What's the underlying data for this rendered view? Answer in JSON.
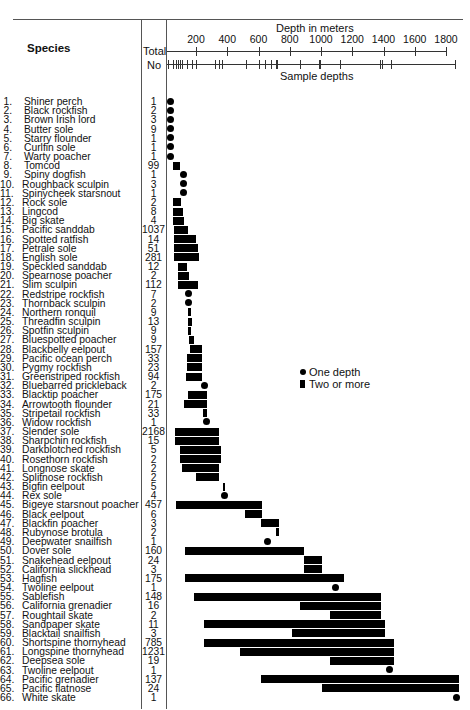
{
  "chart_data": {
    "type": "range",
    "title": "",
    "xlabel": "Depth in meters",
    "x_ticks": [
      200,
      400,
      600,
      800,
      1000,
      1200,
      1400,
      1600,
      1800
    ],
    "xlim": [
      0,
      1850
    ],
    "column_headers": {
      "species": "Species",
      "total": "Total",
      "no": "No"
    },
    "sample_depths_label": "Sample depths",
    "sample_depths": [
      20,
      55,
      75,
      85,
      95,
      110,
      145,
      175,
      200,
      320,
      345,
      365,
      520,
      600,
      640,
      680,
      710,
      720,
      865,
      985,
      995,
      1120,
      1380,
      1390,
      1450,
      1880
    ],
    "legend": [
      {
        "symbol": "dot",
        "label": "One depth"
      },
      {
        "symbol": "bar",
        "label": "Two or more"
      }
    ],
    "species": [
      {
        "n": 1,
        "name": "Shiner perch",
        "total": "1",
        "type": "dot",
        "depth": 35
      },
      {
        "n": 2,
        "name": "Black rockfish",
        "total": "2",
        "type": "dot",
        "depth": 35
      },
      {
        "n": 3,
        "name": "Brown Irish lord",
        "total": "3",
        "type": "dot",
        "depth": 35
      },
      {
        "n": 4,
        "name": "Butter sole",
        "total": "9",
        "type": "dot",
        "depth": 35
      },
      {
        "n": 5,
        "name": "Starry flounder",
        "total": "1",
        "type": "dot",
        "depth": 35
      },
      {
        "n": 6,
        "name": "Curlfin sole",
        "total": "1",
        "type": "dot",
        "depth": 35
      },
      {
        "n": 7,
        "name": "Warty poacher",
        "total": "1",
        "type": "dot",
        "depth": 35
      },
      {
        "n": 8,
        "name": "Tomcod",
        "total": "99",
        "type": "bar",
        "min": 55,
        "max": 100
      },
      {
        "n": 9,
        "name": "Spiny dogfish",
        "total": "1",
        "type": "dot",
        "depth": 120
      },
      {
        "n": 10,
        "name": "Roughback sculpin",
        "total": "3",
        "type": "dot",
        "depth": 120
      },
      {
        "n": 11,
        "name": "Spinycheek starsnout",
        "total": "1",
        "type": "dot",
        "depth": 120
      },
      {
        "n": 12,
        "name": "Rock sole",
        "total": "2",
        "type": "bar",
        "min": 55,
        "max": 105
      },
      {
        "n": 13,
        "name": "Lingcod",
        "total": "8",
        "type": "bar",
        "min": 55,
        "max": 115
      },
      {
        "n": 14,
        "name": "Big skate",
        "total": "4",
        "type": "bar",
        "min": 55,
        "max": 120
      },
      {
        "n": 15,
        "name": "Pacific sanddab",
        "total": "1037",
        "type": "bar",
        "min": 60,
        "max": 150
      },
      {
        "n": 16,
        "name": "Spotted ratfish",
        "total": "14",
        "type": "bar",
        "min": 60,
        "max": 200
      },
      {
        "n": 17,
        "name": "Petrale sole",
        "total": "51",
        "type": "bar",
        "min": 60,
        "max": 215
      },
      {
        "n": 18,
        "name": "English sole",
        "total": "281",
        "type": "bar",
        "min": 60,
        "max": 220
      },
      {
        "n": 19,
        "name": "Speckled sanddab",
        "total": "12",
        "type": "bar",
        "min": 85,
        "max": 140
      },
      {
        "n": 20,
        "name": "Spearnose poacher",
        "total": "2",
        "type": "bar",
        "min": 85,
        "max": 155
      },
      {
        "n": 21,
        "name": "Slim sculpin",
        "total": "112",
        "type": "bar",
        "min": 85,
        "max": 215
      },
      {
        "n": 22,
        "name": "Redstripe rockfish",
        "total": "7",
        "type": "dot",
        "depth": 150
      },
      {
        "n": 23,
        "name": "Thornback sculpin",
        "total": "2",
        "type": "dot",
        "depth": 150
      },
      {
        "n": 24,
        "name": "Northern ronquil",
        "total": "9",
        "type": "bar",
        "min": 150,
        "max": 170
      },
      {
        "n": 25,
        "name": "Threadfin sculpin",
        "total": "13",
        "type": "bar",
        "min": 150,
        "max": 175
      },
      {
        "n": 26,
        "name": "Spotfin sculpin",
        "total": "9",
        "type": "bar",
        "min": 150,
        "max": 170
      },
      {
        "n": 27,
        "name": "Bluespotted poacher",
        "total": "9",
        "type": "bar",
        "min": 155,
        "max": 190
      },
      {
        "n": 28,
        "name": "Blackbelly eelpout",
        "total": "157",
        "type": "bar",
        "min": 160,
        "max": 240
      },
      {
        "n": 29,
        "name": "Pacific ocean perch",
        "total": "33",
        "type": "bar",
        "min": 145,
        "max": 240
      },
      {
        "n": 30,
        "name": "Pygmy rockfish",
        "total": "23",
        "type": "bar",
        "min": 145,
        "max": 240
      },
      {
        "n": 31,
        "name": "Greenstriped rockfish",
        "total": "94",
        "type": "bar",
        "min": 135,
        "max": 240
      },
      {
        "n": 32,
        "name": "Bluebarred prickleback",
        "total": "2",
        "type": "dot",
        "depth": 255
      },
      {
        "n": 33,
        "name": "Blacktip poacher",
        "total": "175",
        "type": "bar",
        "min": 150,
        "max": 270
      },
      {
        "n": 34,
        "name": "Arrowtooth flounder",
        "total": "21",
        "type": "bar",
        "min": 120,
        "max": 270
      },
      {
        "n": 35,
        "name": "Stripetail rockfish",
        "total": "33",
        "type": "bar",
        "min": 245,
        "max": 270
      },
      {
        "n": 36,
        "name": "Widow rockfish",
        "total": "1",
        "type": "dot",
        "depth": 265
      },
      {
        "n": 37,
        "name": "Slender sole",
        "total": "2168",
        "type": "bar",
        "min": 65,
        "max": 345
      },
      {
        "n": 38,
        "name": "Sharpchin rockfish",
        "total": "15",
        "type": "bar",
        "min": 65,
        "max": 345
      },
      {
        "n": 39,
        "name": "Darkblotched rockfish",
        "total": "5",
        "type": "bar",
        "min": 100,
        "max": 360
      },
      {
        "n": 40,
        "name": "Rosethorn rockfish",
        "total": "2",
        "type": "bar",
        "min": 100,
        "max": 360
      },
      {
        "n": 41,
        "name": "Longnose skate",
        "total": "2",
        "type": "bar",
        "min": 110,
        "max": 345
      },
      {
        "n": 42,
        "name": "Splitnose rockfish",
        "total": "2",
        "type": "bar",
        "min": 200,
        "max": 345
      },
      {
        "n": 43,
        "name": "Bigfin eelpout",
        "total": "5",
        "type": "bar",
        "min": 375,
        "max": 385
      },
      {
        "n": 44,
        "name": "Rex sole",
        "total": "4",
        "type": "dot",
        "depth": 380
      },
      {
        "n": 45,
        "name": "Bigeye starsnout poacher",
        "total": "457",
        "type": "bar",
        "min": 70,
        "max": 620
      },
      {
        "n": 46,
        "name": "Black eelpout",
        "total": "6",
        "type": "bar",
        "min": 515,
        "max": 620
      },
      {
        "n": 47,
        "name": "Blackfin poacher",
        "total": "3",
        "type": "bar",
        "min": 615,
        "max": 730
      },
      {
        "n": 48,
        "name": "Rubynose brotula",
        "total": "2",
        "type": "bar",
        "min": 715,
        "max": 730
      },
      {
        "n": 49,
        "name": "Deepwater snailfish",
        "total": "1",
        "type": "dot",
        "depth": 660
      },
      {
        "n": 50,
        "name": "Dover sole",
        "total": "160",
        "type": "bar",
        "min": 130,
        "max": 890
      },
      {
        "n": 51,
        "name": "Snakehead eelpout",
        "total": "24",
        "type": "bar",
        "min": 890,
        "max": 1005
      },
      {
        "n": 52,
        "name": "California slickhead",
        "total": "3",
        "type": "bar",
        "min": 890,
        "max": 1005
      },
      {
        "n": 53,
        "name": "Hagfish",
        "total": "175",
        "type": "bar",
        "min": 130,
        "max": 1145
      },
      {
        "n": 54,
        "name": "Twoline eelpout",
        "total": "1",
        "type": "dot",
        "depth": 1095
      },
      {
        "n": 55,
        "name": "Sablefish",
        "total": "148",
        "type": "bar",
        "min": 190,
        "max": 1385
      },
      {
        "n": 56,
        "name": "California grenadier",
        "total": "16",
        "type": "bar",
        "min": 865,
        "max": 1385
      },
      {
        "n": 57,
        "name": "Roughtail skate",
        "total": "2",
        "type": "bar",
        "min": 1055,
        "max": 1385
      },
      {
        "n": 58,
        "name": "Sandpaper skate",
        "total": "11",
        "type": "bar",
        "min": 250,
        "max": 1410
      },
      {
        "n": 59,
        "name": "Blacktail snailfish",
        "total": "3",
        "type": "bar",
        "min": 815,
        "max": 1410
      },
      {
        "n": 60,
        "name": "Shortspine thornyhead",
        "total": "785",
        "type": "bar",
        "min": 250,
        "max": 1465
      },
      {
        "n": 61,
        "name": "Longspine thornyhead",
        "total": "1231",
        "type": "bar",
        "min": 480,
        "max": 1465
      },
      {
        "n": 62,
        "name": "Deepsea sole",
        "total": "19",
        "type": "bar",
        "min": 1055,
        "max": 1465
      },
      {
        "n": 63,
        "name": "Twoline eelpout",
        "total": "1",
        "type": "dot",
        "depth": 1440
      },
      {
        "n": 64,
        "name": "Pacific grenadier",
        "total": "137",
        "type": "bar",
        "min": 615,
        "max": 1880
      },
      {
        "n": 65,
        "name": "Pacific flatnose",
        "total": "24",
        "type": "bar",
        "min": 1005,
        "max": 1880
      },
      {
        "n": 66,
        "name": "White skate",
        "total": "1",
        "type": "dot",
        "depth": 1870
      }
    ]
  }
}
